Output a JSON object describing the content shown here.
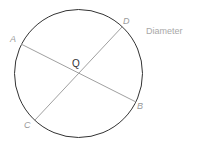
{
  "diagram": {
    "caption": "Diameter",
    "center_label": "Q",
    "points": {
      "A": "A",
      "B": "B",
      "C": "C",
      "D": "D"
    },
    "colors": {
      "circle": "#333333",
      "diameter": "#a0a0a0",
      "label": "#9a9a9a"
    }
  }
}
